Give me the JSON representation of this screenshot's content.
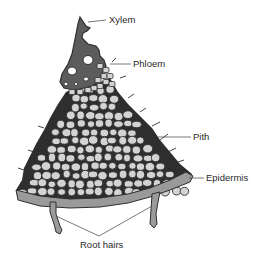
{
  "labels": {
    "xylem": "Xylem",
    "phloem": "Phloem",
    "pith": "Pith",
    "epidermis": "Epidermis",
    "root_hairs": "Root hairs"
  },
  "colors": {
    "xylem_fill": "#5c5c5c",
    "cell_fill": "#d3d3d3",
    "cell_outline": "#2e2e2e",
    "epidermis_fill": "#9a9a9a",
    "label_text": "#2a2a2a"
  }
}
